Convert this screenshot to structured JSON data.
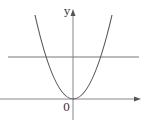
{
  "diagram": {
    "type": "coordinate-plot",
    "axes": {
      "x_label": "",
      "y_label": "y",
      "origin_label": "0"
    },
    "curves": [
      {
        "name": "parabola",
        "kind": "parabola",
        "vertex": "origin",
        "opens": "up"
      },
      {
        "name": "horizontal-line",
        "kind": "line",
        "orientation": "horizontal",
        "position": "above x-axis"
      }
    ],
    "colors": {
      "stroke": "#555555",
      "axis": "#777777",
      "background": "#ffffff"
    }
  }
}
